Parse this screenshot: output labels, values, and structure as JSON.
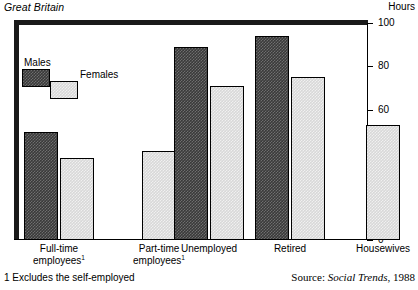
{
  "header": {
    "region": "Great Britain",
    "units": "Hours"
  },
  "footer": {
    "footnote": "1 Excludes the self-employed",
    "source_prefix": "Source: ",
    "source_publication": "Social Trends",
    "source_year": ", 1988"
  },
  "legend": {
    "males_label": "Males",
    "females_label": "Females"
  },
  "colors": {
    "males": "#3a3a3a",
    "females": "#d8d8d8",
    "frame": "#1a1a1a",
    "axis": "#000000"
  },
  "chart_data": {
    "type": "bar",
    "title": "Great Britain",
    "xlabel": "",
    "ylabel": "Hours",
    "ylim": [
      0,
      100
    ],
    "yticks": [
      0,
      20,
      40,
      60,
      80,
      100
    ],
    "ytick_labels": [
      "0",
      "20",
      "40",
      "60",
      "80",
      "100"
    ],
    "grid": false,
    "legend_position": "upper-left",
    "categories": [
      "Full-time employees¹",
      "Part-time employees¹",
      "Unemployed",
      "Retired",
      "Housewives"
    ],
    "category_lines": [
      [
        "Full-time",
        "employees",
        "1"
      ],
      [
        "Part-time",
        "employees",
        "1"
      ],
      [
        "Unemployed",
        "",
        ""
      ],
      [
        "Retired",
        "",
        ""
      ],
      [
        "Housewives",
        "",
        ""
      ]
    ],
    "series": [
      {
        "name": "Males",
        "values": [
          50,
          null,
          89,
          94,
          null
        ]
      },
      {
        "name": "Females",
        "values": [
          38,
          41,
          71,
          75,
          53
        ]
      }
    ],
    "annotations": [
      "1 Excludes the self-employed",
      "Source: Social Trends, 1988"
    ]
  }
}
